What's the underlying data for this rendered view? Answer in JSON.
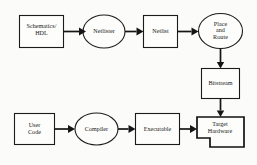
{
  "diagram": {
    "background_color": "#fbfbfa",
    "line_color": "#151515",
    "node_fill": "#fdfdfc",
    "node_stroke": "#1b1b1b",
    "nodes": [
      {
        "id": "schematics-hdl",
        "label": "Schematics/\nHDL",
        "shape": "rect",
        "row": "top"
      },
      {
        "id": "netlister",
        "label": "Netlister",
        "shape": "ellipse",
        "row": "top"
      },
      {
        "id": "netlist",
        "label": "Netlist",
        "shape": "rect",
        "row": "top"
      },
      {
        "id": "place-and-route",
        "label": "Place\nand\nRoute",
        "shape": "ellipse",
        "row": "top"
      },
      {
        "id": "bitstream",
        "label": "Bitstream",
        "shape": "rect",
        "row": "middle"
      },
      {
        "id": "user-code",
        "label": "User\nCode",
        "shape": "rect",
        "row": "bottom"
      },
      {
        "id": "compiler",
        "label": "Compiler",
        "shape": "ellipse",
        "row": "bottom"
      },
      {
        "id": "executable",
        "label": "Executable",
        "shape": "rect",
        "row": "bottom"
      },
      {
        "id": "target-hardware",
        "label": "Target\nHardware",
        "shape": "notched-polygon",
        "row": "bottom"
      }
    ],
    "edges": [
      {
        "id": "edge-schematics-to-netlister",
        "from": "schematics-hdl",
        "to": "netlister",
        "direction": "right"
      },
      {
        "id": "edge-netlister-to-netlist",
        "from": "netlister",
        "to": "netlist",
        "direction": "right"
      },
      {
        "id": "edge-netlist-to-place-route",
        "from": "netlist",
        "to": "place-and-route",
        "direction": "right"
      },
      {
        "id": "edge-place-route-to-bitstream",
        "from": "place-and-route",
        "to": "bitstream",
        "direction": "down"
      },
      {
        "id": "edge-bitstream-to-target",
        "from": "bitstream",
        "to": "target-hardware",
        "direction": "down"
      },
      {
        "id": "edge-usercode-to-compiler",
        "from": "user-code",
        "to": "compiler",
        "direction": "right"
      },
      {
        "id": "edge-compiler-to-executable",
        "from": "compiler",
        "to": "executable",
        "direction": "right"
      },
      {
        "id": "edge-executable-to-target",
        "from": "executable",
        "to": "target-hardware",
        "direction": "right"
      }
    ]
  }
}
